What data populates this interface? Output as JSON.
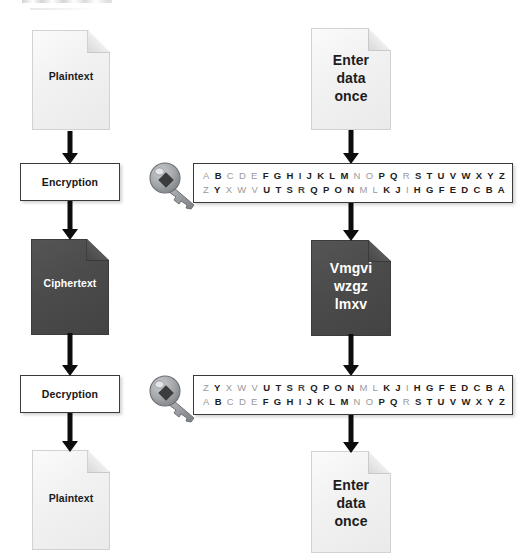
{
  "diagram": {
    "colors": {
      "dark_document": "#4a4a4a",
      "light_document": "#f2f2f2",
      "stroke": "#3b3b3b",
      "arrow": "#0d0d0d",
      "letter_light": "#9a9a9a",
      "letter_dark": "#1d1d1d"
    },
    "left_column": {
      "nodes": [
        {
          "name": "plaintext-document-top",
          "type": "document",
          "shade": "light",
          "label": "Plaintext"
        },
        {
          "name": "encryption-process",
          "type": "process",
          "label": "Encryption"
        },
        {
          "name": "ciphertext-document",
          "type": "document",
          "shade": "dark",
          "label": "Ciphertext"
        },
        {
          "name": "decryption-process",
          "type": "process",
          "label": "Decryption"
        },
        {
          "name": "plaintext-document-bottom",
          "type": "document",
          "shade": "light",
          "label": "Plaintext"
        }
      ]
    },
    "right_column": {
      "nodes": [
        {
          "name": "input-document-top",
          "type": "document",
          "shade": "light",
          "label": "Enter\ndata\nonce"
        },
        {
          "name": "encryption-key-table",
          "type": "key-table"
        },
        {
          "name": "cipher-document",
          "type": "document",
          "shade": "dark",
          "label": "Vmgvi\nwzgz\nlmxv"
        },
        {
          "name": "decryption-key-table",
          "type": "key-table"
        },
        {
          "name": "output-document-bottom",
          "type": "document",
          "shade": "light",
          "label": "Enter\ndata\nonce"
        }
      ]
    },
    "key_tables": {
      "encryption": {
        "icon": "key-icon",
        "rows": [
          {
            "name": "plain-alphabet-row",
            "letters": [
              "A",
              "B",
              "C",
              "D",
              "E",
              "F",
              "G",
              "H",
              "I",
              "J",
              "K",
              "L",
              "M",
              "N",
              "O",
              "P",
              "Q",
              "R",
              "S",
              "T",
              "U",
              "V",
              "W",
              "X",
              "Y",
              "Z"
            ]
          },
          {
            "name": "cipher-alphabet-row",
            "letters": [
              "Z",
              "Y",
              "X",
              "W",
              "V",
              "U",
              "T",
              "S",
              "R",
              "Q",
              "P",
              "O",
              "N",
              "M",
              "L",
              "K",
              "J",
              "I",
              "H",
              "G",
              "F",
              "E",
              "D",
              "C",
              "B",
              "A"
            ]
          }
        ]
      },
      "decryption": {
        "icon": "key-icon",
        "rows": [
          {
            "name": "cipher-alphabet-row",
            "letters": [
              "Z",
              "Y",
              "X",
              "W",
              "V",
              "U",
              "T",
              "S",
              "R",
              "Q",
              "P",
              "O",
              "N",
              "M",
              "L",
              "K",
              "J",
              "I",
              "H",
              "G",
              "F",
              "E",
              "D",
              "C",
              "B",
              "A"
            ]
          },
          {
            "name": "plain-alphabet-row",
            "letters": [
              "A",
              "B",
              "C",
              "D",
              "E",
              "F",
              "G",
              "H",
              "I",
              "J",
              "K",
              "L",
              "M",
              "N",
              "O",
              "P",
              "Q",
              "R",
              "S",
              "T",
              "U",
              "V",
              "W",
              "X",
              "Y",
              "Z"
            ]
          }
        ]
      }
    },
    "connectors": [
      {
        "name": "arrow-plaintext-to-encryption"
      },
      {
        "name": "arrow-encryption-to-ciphertext"
      },
      {
        "name": "arrow-ciphertext-to-decryption"
      },
      {
        "name": "arrow-decryption-to-plaintext"
      },
      {
        "name": "arrow-input-to-encryption-key"
      },
      {
        "name": "arrow-encryption-key-to-cipher"
      },
      {
        "name": "arrow-cipher-to-decryption-key"
      },
      {
        "name": "arrow-decryption-key-to-output"
      }
    ]
  }
}
